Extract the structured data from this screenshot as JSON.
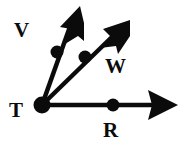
{
  "figure": {
    "kind": "geometry-ray-diagram",
    "background_color": "#ffffff",
    "ink_color": "#0b0b0b",
    "width": 188,
    "height": 152,
    "vertex": {
      "name": "T",
      "label": "T",
      "x": 42,
      "y": 105
    },
    "rays": [
      {
        "name": "ray-TV",
        "label": "V",
        "through_point_label": "V",
        "tip_x": 80,
        "tip_y": 6,
        "dot_x": 57,
        "dot_y": 52,
        "label_x": 14,
        "label_y": 20,
        "arrowhead": "solid-triangle"
      },
      {
        "name": "ray-TW",
        "label": "W",
        "through_point_label": "W",
        "tip_x": 130,
        "tip_y": 20,
        "dot_x": 85,
        "dot_y": 57,
        "label_x": 105,
        "label_y": 56,
        "arrowhead": "solid-triangle"
      },
      {
        "name": "ray-TR",
        "label": "R",
        "through_point_label": "R",
        "tip_x": 178,
        "tip_y": 105,
        "dot_x": 113,
        "dot_y": 105,
        "label_x": 103,
        "label_y": 120,
        "arrowhead": "solid-triangle"
      }
    ],
    "labels": {
      "v": "V",
      "t": "T",
      "w": "W",
      "r": "R"
    },
    "stroke_width": 4,
    "dot_radius": 6,
    "vertex_dot_radius": 8
  }
}
